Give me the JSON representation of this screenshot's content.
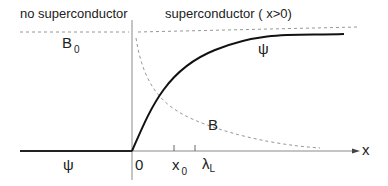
{
  "regions": {
    "left_title": "no  superconductor",
    "right_title": "superconductor  ( x>0)"
  },
  "labels": {
    "b0_main": "B",
    "b0_sub": "0",
    "psi_right": "ψ",
    "psi_left": "ψ",
    "b_curve": "B",
    "origin": "0",
    "x0_main": "x",
    "x0_sub": "0",
    "lambda_main": "λ",
    "lambda_sub": "L",
    "x_axis": "x"
  },
  "colors": {
    "axis": "#7a7a7a",
    "psi_curve": "#111111",
    "dashed": "#8a8a8a",
    "text": "#222222"
  }
}
